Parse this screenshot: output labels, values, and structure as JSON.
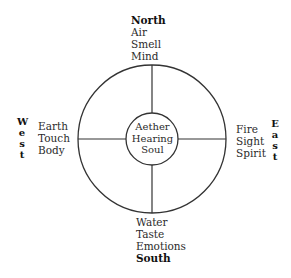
{
  "diagram": {
    "colors": {
      "line": "#333333",
      "text": "#2b2b2b",
      "background": "#ffffff"
    },
    "outer_circle": {
      "cx": 152,
      "cy": 139,
      "r": 74
    },
    "inner_circle": {
      "cx": 152,
      "cy": 139,
      "r": 26
    },
    "north": {
      "heading": "North",
      "element": "Air",
      "sense": "Smell",
      "aspect": "Mind"
    },
    "south": {
      "element": "Water",
      "sense": "Taste",
      "aspect": "Emotions",
      "heading": "South"
    },
    "west": {
      "heading_letters": [
        "W",
        "e",
        "s",
        "t"
      ],
      "element": "Earth",
      "sense": "Touch",
      "aspect": "Body"
    },
    "east": {
      "heading_letters": [
        "E",
        "a",
        "s",
        "t"
      ],
      "element": "Fire",
      "sense": "Sight",
      "aspect": "Spirit"
    },
    "center": {
      "element": "Aether",
      "sense": "Hearing",
      "aspect": "Soul"
    }
  }
}
